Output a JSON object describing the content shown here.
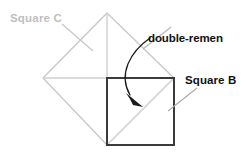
{
  "figure": {
    "width": 246,
    "height": 159,
    "background": "#ffffff",
    "labels": {
      "square_c": "Square C",
      "double_remen": "double-remen",
      "square_b": "Square B"
    },
    "colors": {
      "square_c_outline": "#c9c9c9",
      "square_c_text": "#bfbfbf",
      "square_b_outline": "#3a3a3a",
      "construction_line": "#cfcfcf",
      "leader_line": "#b5b5b5",
      "arrow": "#1a1a1a",
      "text": "#111111"
    },
    "geometry": {
      "square_c": {
        "shape": "diamond",
        "vertices": [
          [
            107,
            13
          ],
          [
            174,
            78
          ],
          [
            107,
            145
          ],
          [
            43,
            78
          ]
        ]
      },
      "square_b": {
        "shape": "square",
        "x": 107,
        "y": 78,
        "size": 67,
        "vertices": [
          [
            107,
            78
          ],
          [
            174,
            78
          ],
          [
            174,
            145
          ],
          [
            107,
            145
          ]
        ]
      },
      "construction_lines": [
        {
          "name": "vertical-axis",
          "from": [
            107,
            13
          ],
          "to": [
            107,
            145
          ]
        },
        {
          "name": "horizontal-axis",
          "from": [
            43,
            78
          ],
          "to": [
            174,
            78
          ]
        },
        {
          "name": "square-b-diagonal",
          "from": [
            107,
            145
          ],
          "to": [
            174,
            78
          ]
        }
      ],
      "leader_lines": [
        {
          "name": "square-c-leader",
          "from": [
            62,
            24
          ],
          "to": [
            93,
            51
          ]
        },
        {
          "name": "square-b-leader",
          "from": [
            168,
            110
          ],
          "to": [
            197,
            88
          ]
        },
        {
          "name": "double-remen-leader",
          "from": [
            143,
            48
          ],
          "to": [
            170,
            26
          ]
        }
      ],
      "curved_arrow": {
        "name": "double-remen-arrow",
        "path": "M150,38 C131,50 119,72 128,93",
        "arrow_tip": [
          141,
          106
        ]
      }
    }
  }
}
